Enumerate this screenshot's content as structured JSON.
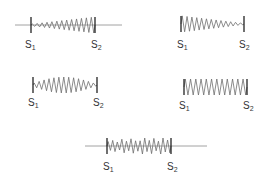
{
  "colors": {
    "wave": "#6e6e6e",
    "baseline": "#8a8a8a",
    "marker": "#222222",
    "text": "#333333"
  },
  "panels": [
    {
      "id": "p1",
      "desc": "amplitude increasing from S1 to S2",
      "cy": 25,
      "s1x": 31,
      "s2x": 95,
      "lineStart": 15,
      "lineEnd": 122,
      "envelope": "increasing",
      "cycles": 13,
      "s1_label": {
        "base": "S",
        "sub": "1",
        "x": 25,
        "y": 40
      },
      "s2_label": {
        "base": "S",
        "sub": "2",
        "x": 91,
        "y": 40
      }
    },
    {
      "id": "p2",
      "desc": "amplitude decreasing from S1 to S2",
      "cy": 24,
      "s1x": 181,
      "s2x": 244,
      "lineStart": null,
      "lineEnd": null,
      "envelope": "decreasing",
      "cycles": 13,
      "s1_label": {
        "base": "S",
        "sub": "1",
        "x": 177,
        "y": 40
      },
      "s2_label": {
        "base": "S",
        "sub": "2",
        "x": 239,
        "y": 40
      }
    },
    {
      "id": "p3",
      "desc": "amplitude peaking at middle",
      "cy": 85,
      "s1x": 33,
      "s2x": 97,
      "lineStart": null,
      "lineEnd": null,
      "envelope": "peak",
      "cycles": 13,
      "s1_label": {
        "base": "S",
        "sub": "1",
        "x": 28,
        "y": 98
      },
      "s2_label": {
        "base": "S",
        "sub": "2",
        "x": 93,
        "y": 98
      }
    },
    {
      "id": "p4",
      "desc": "uniform amplitude",
      "cy": 87,
      "s1x": 184,
      "s2x": 247,
      "lineStart": null,
      "lineEnd": null,
      "envelope": "uniform",
      "cycles": 12,
      "s1_label": {
        "base": "S",
        "sub": "1",
        "x": 179,
        "y": 101
      },
      "s2_label": {
        "base": "S",
        "sub": "2",
        "x": 243,
        "y": 101
      }
    },
    {
      "id": "p5",
      "desc": "irregular amplitude",
      "cy": 146,
      "s1x": 107,
      "s2x": 171,
      "lineStart": 85,
      "lineEnd": 207,
      "envelope": "irregular",
      "cycles": 14,
      "s1_label": {
        "base": "S",
        "sub": "1",
        "x": 103,
        "y": 162
      },
      "s2_label": {
        "base": "S",
        "sub": "2",
        "x": 167,
        "y": 162
      }
    }
  ]
}
